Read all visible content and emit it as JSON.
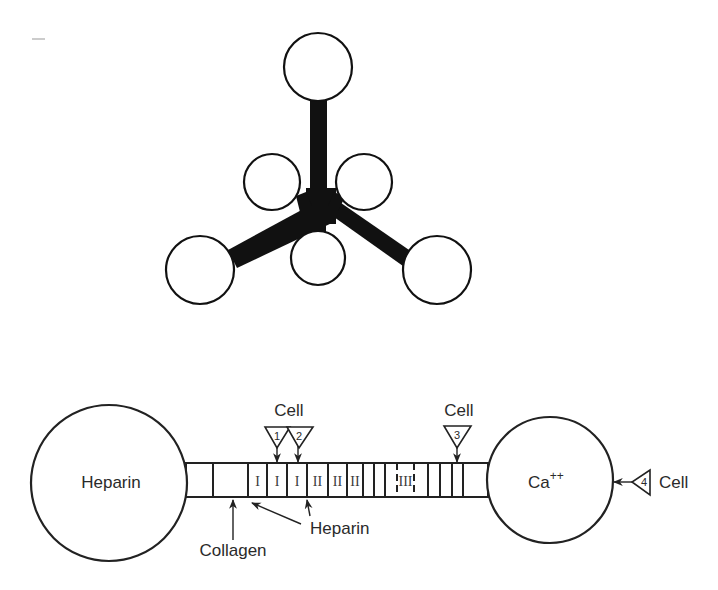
{
  "top_diagram": {
    "description": "Tetrahedral-like molecule: central hub with four arms ending in large globular domains and three smaller globular domains near the center",
    "arm_color": "#111111",
    "large_globes": 4,
    "small_globes": 3
  },
  "bottom_diagram": {
    "left_globe": {
      "label": "Heparin"
    },
    "right_globe": {
      "label": "Ca",
      "superscript": "++"
    },
    "rod_segments": {
      "type_I_label": "I",
      "type_II_label": "II",
      "type_III_label": "III"
    },
    "cell_sites": [
      {
        "number": "1",
        "label": "Cell"
      },
      {
        "number": "2",
        "label": "Cell"
      },
      {
        "number": "3",
        "label": "Cell"
      },
      {
        "number": "4",
        "label": "Cell"
      }
    ],
    "cell_label_12": "Cell",
    "cell_label_3": "Cell",
    "cell_label_4": "Cell",
    "annotations": {
      "collagen": "Collagen",
      "heparin": "Heparin"
    }
  },
  "corner_mark": "–"
}
